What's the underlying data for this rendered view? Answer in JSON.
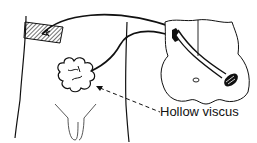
{
  "diagram": {
    "labels": {
      "hollow_viscus": "Hollow viscus"
    },
    "colors": {
      "ink": "#111111",
      "background": "#ffffff"
    }
  }
}
